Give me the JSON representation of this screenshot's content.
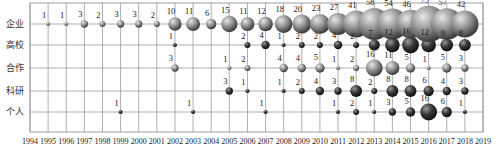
{
  "chart_data": {
    "type": "bubble",
    "title": "",
    "xlabel": "",
    "ylabel": "",
    "x": [
      1994,
      1995,
      1996,
      1997,
      1998,
      1999,
      2000,
      2001,
      2002,
      2003,
      2004,
      2005,
      2006,
      2007,
      2008,
      2009,
      2010,
      2011,
      2012,
      2013,
      2014,
      2015,
      2016,
      2017,
      2018,
      2019
    ],
    "categories": [
      "企业",
      "高校",
      "合作",
      "科研",
      "个人"
    ],
    "grid": true,
    "legend": "none",
    "series": [
      {
        "name": "企业",
        "color": "#8a8a8a",
        "points": [
          [
            1995,
            1
          ],
          [
            1996,
            1
          ],
          [
            1997,
            3
          ],
          [
            1998,
            2
          ],
          [
            1999,
            3
          ],
          [
            2000,
            3
          ],
          [
            2001,
            2
          ],
          [
            2002,
            10
          ],
          [
            2003,
            11
          ],
          [
            2004,
            6
          ],
          [
            2005,
            15
          ],
          [
            2006,
            11
          ],
          [
            2007,
            12
          ],
          [
            2008,
            18
          ],
          [
            2009,
            20
          ],
          [
            2010,
            23
          ],
          [
            2011,
            27
          ],
          [
            2012,
            41
          ],
          [
            2013,
            58
          ],
          [
            2014,
            54
          ],
          [
            2015,
            46
          ],
          [
            2016,
            75
          ],
          [
            2017,
            57
          ],
          [
            2018,
            42
          ]
        ]
      },
      {
        "name": "高校",
        "color": "#3a3a3a",
        "points": [
          [
            2002,
            1
          ],
          [
            2006,
            2
          ],
          [
            2007,
            4
          ],
          [
            2008,
            1
          ],
          [
            2009,
            2
          ],
          [
            2010,
            2
          ],
          [
            2011,
            4
          ],
          [
            2012,
            2
          ],
          [
            2013,
            7
          ],
          [
            2014,
            12
          ],
          [
            2015,
            16
          ],
          [
            2016,
            12
          ],
          [
            2017,
            9
          ],
          [
            2018,
            8
          ]
        ]
      },
      {
        "name": "合作",
        "color": "#8f8f8f",
        "points": [
          [
            2002,
            3
          ],
          [
            2005,
            1
          ],
          [
            2006,
            2
          ],
          [
            2008,
            4
          ],
          [
            2009,
            4
          ],
          [
            2010,
            5
          ],
          [
            2011,
            1
          ],
          [
            2012,
            2
          ],
          [
            2013,
            16
          ],
          [
            2014,
            11
          ],
          [
            2015,
            5
          ],
          [
            2016,
            1
          ],
          [
            2017,
            5
          ],
          [
            2018,
            3
          ]
        ]
      },
      {
        "name": "科研",
        "color": "#2e2e2e",
        "points": [
          [
            2005,
            3
          ],
          [
            2006,
            1
          ],
          [
            2008,
            1
          ],
          [
            2009,
            2
          ],
          [
            2010,
            4
          ],
          [
            2011,
            3
          ],
          [
            2012,
            8
          ],
          [
            2013,
            2
          ],
          [
            2014,
            8
          ],
          [
            2015,
            8
          ],
          [
            2016,
            6
          ],
          [
            2017,
            4
          ],
          [
            2018,
            3
          ]
        ]
      },
      {
        "name": "个人",
        "color": "#4a4a4a",
        "points": [
          [
            1999,
            1
          ],
          [
            2003,
            1
          ],
          [
            2007,
            1
          ],
          [
            2011,
            1
          ],
          [
            2012,
            2
          ],
          [
            2013,
            1
          ],
          [
            2014,
            3
          ],
          [
            2015,
            5
          ],
          [
            2016,
            16
          ],
          [
            2017,
            6
          ],
          [
            2018,
            1
          ]
        ]
      }
    ]
  }
}
